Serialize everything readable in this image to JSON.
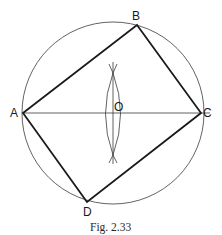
{
  "figure": {
    "caption": "Fig. 2.33",
    "colors": {
      "ink": "#1a1a1a",
      "thin": "#3a3a3a",
      "background": "#ffffff"
    },
    "circle": {
      "center_label": "O",
      "cx": 113,
      "cy": 113,
      "r": 91
    },
    "points": {
      "A": {
        "label": "A",
        "x": 23,
        "y": 113
      },
      "B": {
        "label": "B",
        "x": 137,
        "y": 25
      },
      "C": {
        "label": "C",
        "x": 201,
        "y": 113
      },
      "D": {
        "label": "D",
        "x": 87,
        "y": 202
      },
      "O": {
        "label": "O",
        "x": 113,
        "y": 113
      }
    },
    "diameter": {
      "from": "A",
      "to": "C",
      "extends_to_x": 210
    },
    "bisector": {
      "x": 113,
      "y_top": 62,
      "y_bottom": 164,
      "arc_cross_top": 73,
      "arc_cross_bottom": 155
    },
    "rectangle": [
      "A",
      "B",
      "C",
      "D"
    ]
  }
}
